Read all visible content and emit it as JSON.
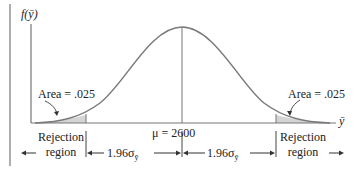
{
  "diagram": {
    "type": "normal-distribution-two-tailed-rejection",
    "y_axis_label": "f(ȳ)",
    "x_axis_label": "ȳ",
    "mean_label": "μ = 2600",
    "left_area_label": "Area = .025",
    "right_area_label": "Area = .025",
    "left_region_label_line1": "Rejection",
    "left_region_label_line2": "region",
    "right_region_label_line1": "Rejection",
    "right_region_label_line2": "region",
    "left_distance_label": "1.96σ",
    "right_distance_label": "1.96σ",
    "sigma_subscript": "ȳ",
    "shade_color": "#d4d4d4",
    "curve_color": "#7a7a7a"
  }
}
